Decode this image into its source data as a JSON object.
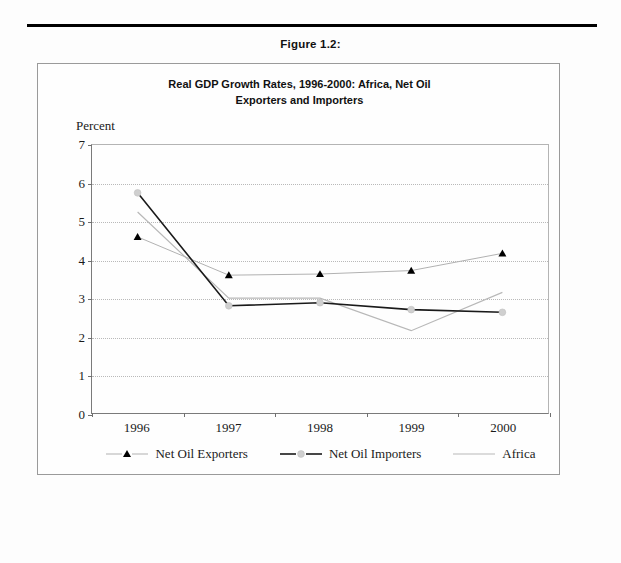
{
  "figure": {
    "caption": "Figure 1.2:"
  },
  "chart_data": {
    "type": "line",
    "title": "Real GDP Growth Rates, 1996-2000: Africa, Net Oil Exporters and Importers",
    "title_lines": [
      "Real GDP Growth Rates, 1996-2000: Africa, Net Oil",
      "Exporters and Importers"
    ],
    "subtitle": "",
    "xlabel": "",
    "ylabel": "Percent",
    "categories": [
      "1996",
      "1997",
      "1998",
      "1999",
      "2000"
    ],
    "ylim": [
      0,
      7
    ],
    "yticks": [
      0,
      1,
      2,
      3,
      4,
      5,
      6,
      7
    ],
    "ytick_labels": [
      "0",
      "1",
      "2",
      "3",
      "4",
      "5",
      "6",
      "7"
    ],
    "grid": true,
    "grid_style": "dotted-horizontal",
    "legend_position": "bottom",
    "series": [
      {
        "name": "Net Oil Exporters",
        "values": [
          4.6,
          3.6,
          3.63,
          3.72,
          4.17
        ],
        "marker": "triangle",
        "marker_color": "#000000",
        "line_color": "#b0b0b0",
        "line_width": 1.0
      },
      {
        "name": "Net Oil Importers",
        "values": [
          5.75,
          2.8,
          2.88,
          2.7,
          2.63
        ],
        "marker": "circle",
        "marker_color": "#cfcfcf",
        "line_color": "#1a1a1a",
        "line_width": 1.6
      },
      {
        "name": "Africa",
        "values": [
          5.25,
          3.0,
          3.0,
          2.15,
          3.15
        ],
        "marker": "none",
        "marker_color": "#b8b8b8",
        "line_color": "#b8b8b8",
        "line_width": 1.2
      }
    ]
  },
  "legend": {
    "items": [
      {
        "label": "Net Oil Exporters"
      },
      {
        "label": "Net Oil Importers"
      },
      {
        "label": "Africa"
      }
    ]
  }
}
